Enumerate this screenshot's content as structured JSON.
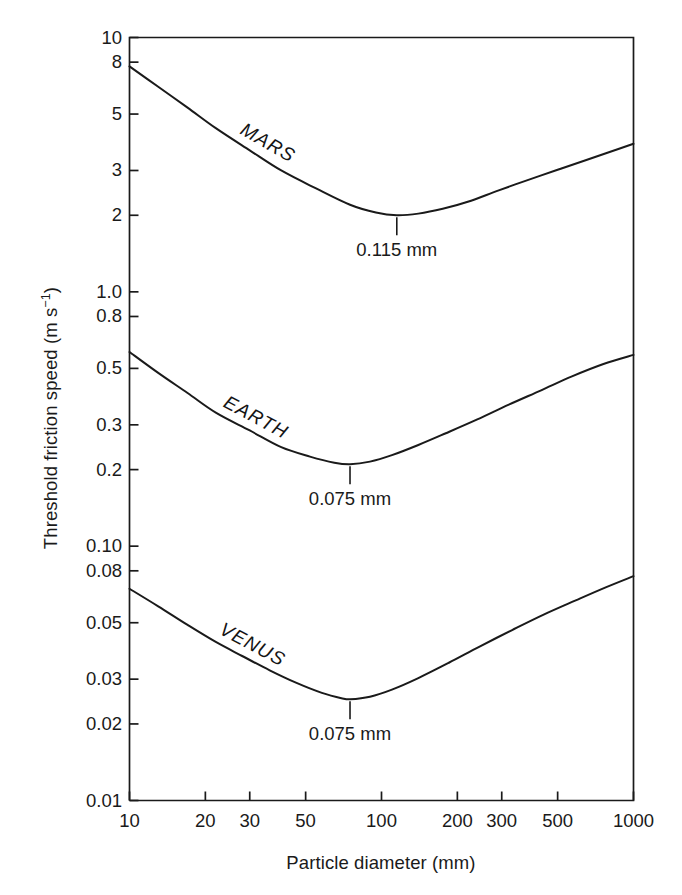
{
  "chart_data": {
    "type": "line",
    "title": "",
    "xlabel": "Particle diameter (mm)",
    "ylabel_text": "Threshold friction speed (m s",
    "ylabel_sup": "−1",
    "ylabel_tail": ")",
    "ylabel_full": "Threshold friction speed (m s−1)",
    "xscale": "log",
    "yscale": "log",
    "xlim": [
      10,
      1000
    ],
    "ylim": [
      0.01,
      10
    ],
    "grid": false,
    "legend": "inline curve labels",
    "xticks": [
      10,
      20,
      30,
      50,
      100,
      200,
      300,
      500,
      1000
    ],
    "xtick_labels": [
      "10",
      "20",
      "30",
      "50",
      "100",
      "200",
      "300",
      "500",
      "1000"
    ],
    "yticks": [
      10,
      8,
      5,
      3,
      2,
      1.0,
      0.8,
      0.5,
      0.3,
      0.2,
      0.1,
      0.08,
      0.05,
      0.03,
      0.02,
      0.01
    ],
    "ytick_labels": [
      "10",
      "8",
      "5",
      "3",
      "2",
      "1.0",
      "0.8",
      "0.5",
      "0.3",
      "0.2",
      "0.10",
      "0.08",
      "0.05",
      "0.03",
      "0.02",
      "0.01"
    ],
    "series": [
      {
        "name": "MARS",
        "label": "MARS",
        "minimum_label": "0.115 mm",
        "minimum_x": 115,
        "minimum_y": 2.0,
        "x": [
          10,
          13,
          17,
          22,
          30,
          40,
          55,
          75,
          95,
          115,
          140,
          175,
          220,
          290,
          380,
          500,
          650,
          820,
          1000
        ],
        "y": [
          7.7,
          6.4,
          5.3,
          4.4,
          3.6,
          3.0,
          2.55,
          2.2,
          2.05,
          2.0,
          2.03,
          2.12,
          2.26,
          2.5,
          2.75,
          3.02,
          3.3,
          3.57,
          3.82
        ]
      },
      {
        "name": "EARTH",
        "label": "EARTH",
        "minimum_label": "0.075 mm",
        "minimum_x": 75,
        "minimum_y": 0.21,
        "x": [
          10,
          13,
          17,
          22,
          30,
          40,
          52,
          65,
          75,
          90,
          110,
          140,
          180,
          240,
          320,
          430,
          570,
          760,
          1000
        ],
        "y": [
          0.58,
          0.48,
          0.4,
          0.335,
          0.285,
          0.245,
          0.225,
          0.213,
          0.21,
          0.215,
          0.228,
          0.25,
          0.278,
          0.315,
          0.36,
          0.41,
          0.465,
          0.52,
          0.565
        ]
      },
      {
        "name": "VENUS",
        "label": "VENUS",
        "minimum_label": "0.075 mm",
        "minimum_x": 75,
        "minimum_y": 0.025,
        "x": [
          10,
          13,
          17,
          22,
          28,
          36,
          46,
          58,
          70,
          75,
          90,
          110,
          140,
          185,
          245,
          330,
          440,
          590,
          780,
          1000
        ],
        "y": [
          0.068,
          0.058,
          0.049,
          0.042,
          0.037,
          0.0325,
          0.029,
          0.0265,
          0.0252,
          0.025,
          0.0256,
          0.0273,
          0.0303,
          0.0348,
          0.0403,
          0.0468,
          0.0538,
          0.0612,
          0.069,
          0.0762
        ]
      }
    ]
  },
  "style": {
    "axis_color": "#1a1a1a",
    "curve_color": "#1a1a1a",
    "text_color": "#1a1a1a",
    "background": "#ffffff"
  }
}
